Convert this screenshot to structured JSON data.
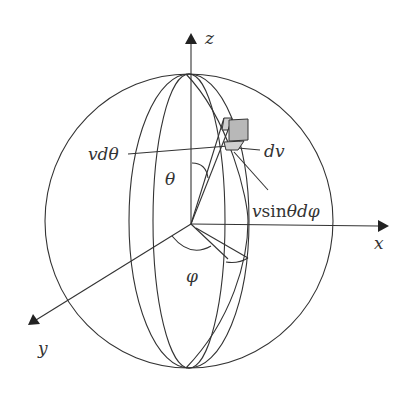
{
  "diagram": {
    "axes": {
      "z": "z",
      "x": "x",
      "y": "y"
    },
    "labels": {
      "theta": "θ",
      "phi": "φ",
      "v_dtheta": "vdθ",
      "dv": "dv",
      "v_sin_theta_dphi_v": "v",
      "v_sin_theta_dphi_sin": "sin",
      "v_sin_theta_dphi_rest": "θdφ"
    },
    "colors": {
      "stroke": "#333333",
      "cube_face": "#b8b8b8",
      "cube_side": "#cfcfcf"
    }
  }
}
